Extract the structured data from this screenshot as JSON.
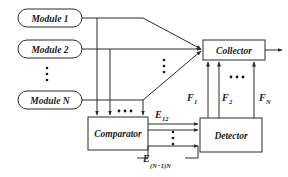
{
  "diagram": {
    "background_color": "#ffffff",
    "line_color": "#2b2b2b",
    "text_color": "#1a1a1a",
    "modules": [
      {
        "id": "module-1",
        "label": "Module 1"
      },
      {
        "id": "module-2",
        "label": "Module 2"
      },
      {
        "id": "module-n",
        "label": "Module N"
      }
    ],
    "blocks": [
      {
        "id": "collector",
        "label": "Collector"
      },
      {
        "id": "comparator",
        "label": "Comparator"
      },
      {
        "id": "detector",
        "label": "Detector"
      }
    ],
    "signals": {
      "e_first": {
        "base": "E",
        "sub": "12"
      },
      "e_last": {
        "base": "E",
        "sub": "(N−1)N"
      },
      "f_first": {
        "base": "F",
        "sub": "1"
      },
      "f_second": {
        "base": "F",
        "sub": "2"
      },
      "f_last": {
        "base": "F",
        "sub": "N"
      }
    },
    "ellipses": [
      {
        "id": "modules-vertical-ellipsis",
        "glyph": "vertical-dots"
      },
      {
        "id": "collector-inputs-vertical-ellipsis",
        "glyph": "vertical-dots"
      },
      {
        "id": "comparator-inputs-horizontal-ellipsis",
        "glyph": "horizontal-dots"
      },
      {
        "id": "e-signals-vertical-ellipsis",
        "glyph": "vertical-dots"
      },
      {
        "id": "f-signals-horizontal-ellipsis",
        "glyph": "horizontal-dots"
      }
    ],
    "output": {
      "id": "collector-output",
      "label": ""
    }
  }
}
